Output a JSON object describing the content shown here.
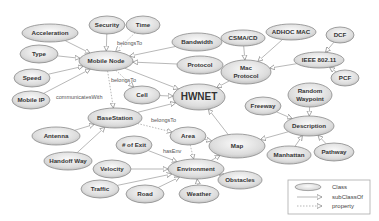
{
  "diagram": {
    "nodes": [
      {
        "id": "acceleration",
        "label": "Acceleration",
        "x": 50,
        "y": 33,
        "rx": 28,
        "ry": 9
      },
      {
        "id": "security",
        "label": "Security",
        "x": 107,
        "y": 25,
        "rx": 18,
        "ry": 9
      },
      {
        "id": "time",
        "label": "Time",
        "x": 143,
        "y": 25,
        "rx": 17,
        "ry": 9
      },
      {
        "id": "bandwidth",
        "label": "Bandwidth",
        "x": 197,
        "y": 42,
        "rx": 25,
        "ry": 9
      },
      {
        "id": "type",
        "label": "Type",
        "x": 39,
        "y": 54,
        "rx": 19,
        "ry": 9
      },
      {
        "id": "mobile_node",
        "label": "Mobile Node",
        "x": 106,
        "y": 61,
        "rx": 27,
        "ry": 10
      },
      {
        "id": "protocol",
        "label": "Protocol",
        "x": 200,
        "y": 65,
        "rx": 23,
        "ry": 9
      },
      {
        "id": "speed",
        "label": "Speed",
        "x": 32,
        "y": 78,
        "rx": 18,
        "ry": 9
      },
      {
        "id": "mobile_ip",
        "label": "Mobile IP",
        "x": 31,
        "y": 100,
        "rx": 19,
        "ry": 9
      },
      {
        "id": "cell",
        "label": "Cell",
        "x": 142,
        "y": 95,
        "rx": 18,
        "ry": 9
      },
      {
        "id": "hwnet",
        "label": "HWNET",
        "x": 199,
        "y": 97,
        "rx": 26,
        "ry": 13,
        "big": true
      },
      {
        "id": "csma_cd",
        "label": "CSMA/CD",
        "x": 243,
        "y": 38,
        "rx": 22,
        "ry": 8
      },
      {
        "id": "adhoc_mac",
        "label": "ADHOC MAC",
        "x": 291,
        "y": 32,
        "rx": 25,
        "ry": 8
      },
      {
        "id": "dcf",
        "label": "DCF",
        "x": 340,
        "y": 35,
        "rx": 14,
        "ry": 8
      },
      {
        "id": "mac_protocol",
        "label": "Mac|Protocol",
        "x": 246,
        "y": 72,
        "rx": 25,
        "ry": 12
      },
      {
        "id": "ieee",
        "label": "IEEE 802.11",
        "x": 319,
        "y": 60,
        "rx": 25,
        "ry": 8
      },
      {
        "id": "pcf",
        "label": "PCF",
        "x": 345,
        "y": 78,
        "rx": 14,
        "ry": 8
      },
      {
        "id": "random_waypoint",
        "label": "Random|Waypoint",
        "x": 310,
        "y": 95,
        "rx": 22,
        "ry": 12
      },
      {
        "id": "freeway",
        "label": "Freeway",
        "x": 263,
        "y": 106,
        "rx": 18,
        "ry": 9
      },
      {
        "id": "description",
        "label": "Description",
        "x": 309,
        "y": 126,
        "rx": 25,
        "ry": 10
      },
      {
        "id": "basestation",
        "label": "BaseStation",
        "x": 115,
        "y": 118,
        "rx": 27,
        "ry": 10
      },
      {
        "id": "area",
        "label": "Area",
        "x": 188,
        "y": 136,
        "rx": 18,
        "ry": 9
      },
      {
        "id": "map",
        "label": "Map",
        "x": 237,
        "y": 146,
        "rx": 28,
        "ry": 12
      },
      {
        "id": "manhattan",
        "label": "Manhattan",
        "x": 289,
        "y": 155,
        "rx": 22,
        "ry": 9
      },
      {
        "id": "pathway",
        "label": "Pathway",
        "x": 334,
        "y": 152,
        "rx": 20,
        "ry": 9
      },
      {
        "id": "antenna",
        "label": "Antenna",
        "x": 56,
        "y": 136,
        "rx": 24,
        "ry": 9
      },
      {
        "id": "handoff_way",
        "label": "Handoff Way",
        "x": 68,
        "y": 161,
        "rx": 24,
        "ry": 9
      },
      {
        "id": "num_exit",
        "label": "# of Exit",
        "x": 134,
        "y": 145,
        "rx": 18,
        "ry": 9
      },
      {
        "id": "velocity",
        "label": "Velocity",
        "x": 112,
        "y": 169,
        "rx": 19,
        "ry": 9
      },
      {
        "id": "environment",
        "label": "Environment",
        "x": 196,
        "y": 169,
        "rx": 28,
        "ry": 10
      },
      {
        "id": "obstacles",
        "label": "Obstacles",
        "x": 240,
        "y": 180,
        "rx": 22,
        "ry": 9
      },
      {
        "id": "traffic",
        "label": "Traffic",
        "x": 100,
        "y": 189,
        "rx": 19,
        "ry": 9
      },
      {
        "id": "road",
        "label": "Road",
        "x": 145,
        "y": 194,
        "rx": 19,
        "ry": 9
      },
      {
        "id": "weather",
        "label": "Weather",
        "x": 199,
        "y": 194,
        "rx": 20,
        "ry": 9
      }
    ],
    "edges": [
      {
        "from": "acceleration",
        "to": "mobile_node",
        "kind": "subClassOf"
      },
      {
        "from": "security",
        "to": "mobile_node",
        "kind": "subClassOf"
      },
      {
        "from": "time",
        "to": "mobile_node",
        "kind": "property"
      },
      {
        "from": "bandwidth",
        "to": "mobile_node",
        "kind": "subClassOf"
      },
      {
        "from": "type",
        "to": "mobile_node",
        "kind": "subClassOf"
      },
      {
        "from": "protocol",
        "to": "mobile_node",
        "kind": "subClassOf"
      },
      {
        "from": "speed",
        "to": "mobile_node",
        "kind": "subClassOf"
      },
      {
        "from": "mobile_ip",
        "to": "mobile_node",
        "kind": "subClassOf"
      },
      {
        "from": "mobile_node",
        "to": "hwnet",
        "kind": "subClassOf"
      },
      {
        "from": "mobile_node",
        "to": "cell",
        "kind": "property"
      },
      {
        "from": "mobile_node",
        "to": "basestation",
        "kind": "property"
      },
      {
        "from": "cell",
        "to": "hwnet",
        "kind": "subClassOf"
      },
      {
        "from": "basestation",
        "to": "hwnet",
        "kind": "subClassOf"
      },
      {
        "from": "basestation",
        "to": "area",
        "kind": "property"
      },
      {
        "from": "mac_protocol",
        "to": "hwnet",
        "kind": "subClassOf"
      },
      {
        "from": "csma_cd",
        "to": "mac_protocol",
        "kind": "subClassOf"
      },
      {
        "from": "adhoc_mac",
        "to": "mac_protocol",
        "kind": "subClassOf"
      },
      {
        "from": "ieee",
        "to": "mac_protocol",
        "kind": "subClassOf"
      },
      {
        "from": "dcf",
        "to": "ieee",
        "kind": "subClassOf"
      },
      {
        "from": "pcf",
        "to": "ieee",
        "kind": "subClassOf"
      },
      {
        "from": "map",
        "to": "hwnet",
        "kind": "subClassOf"
      },
      {
        "from": "description",
        "to": "map",
        "kind": "subClassOf"
      },
      {
        "from": "random_waypoint",
        "to": "description",
        "kind": "subClassOf"
      },
      {
        "from": "freeway",
        "to": "description",
        "kind": "subClassOf"
      },
      {
        "from": "manhattan",
        "to": "description",
        "kind": "subClassOf"
      },
      {
        "from": "pathway",
        "to": "description",
        "kind": "subClassOf"
      },
      {
        "from": "area",
        "to": "map",
        "kind": "subClassOf"
      },
      {
        "from": "area",
        "to": "environment",
        "kind": "property"
      },
      {
        "from": "environment",
        "to": "map",
        "kind": "subClassOf"
      },
      {
        "from": "antenna",
        "to": "basestation",
        "kind": "subClassOf"
      },
      {
        "from": "handoff_way",
        "to": "basestation",
        "kind": "subClassOf"
      },
      {
        "from": "num_exit",
        "to": "environment",
        "kind": "subClassOf"
      },
      {
        "from": "velocity",
        "to": "environment",
        "kind": "subClassOf"
      },
      {
        "from": "traffic",
        "to": "environment",
        "kind": "subClassOf"
      },
      {
        "from": "road",
        "to": "environment",
        "kind": "subClassOf"
      },
      {
        "from": "weather",
        "to": "environment",
        "kind": "subClassOf"
      },
      {
        "from": "obstacles",
        "to": "environment",
        "kind": "subClassOf"
      }
    ],
    "edge_labels": [
      {
        "text": "belongsTo",
        "x": 117,
        "y": 45
      },
      {
        "text": "belongsTo",
        "x": 111,
        "y": 82
      },
      {
        "text": "communicatesWith",
        "x": 56,
        "y": 99
      },
      {
        "text": "belongsTo",
        "x": 151,
        "y": 122
      },
      {
        "text": "hasEnv",
        "x": 163,
        "y": 153
      }
    ],
    "legend": {
      "class_label": "Class",
      "subclass_label": "subClassOf",
      "property_label": "property"
    }
  },
  "colors": {
    "node_fill_top": "#f2f2f2",
    "node_fill_bottom": "#c8c8c8",
    "node_stroke": "#8a8a8a",
    "edge": "#9a9a9a",
    "text": "#333333"
  }
}
